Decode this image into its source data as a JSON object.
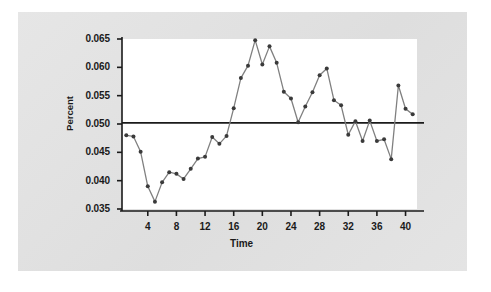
{
  "figure": {
    "background_color": "#ffffff",
    "panel_color": "#e2e2e2",
    "plot_background": "#ffffff"
  },
  "axis": {
    "y_label": "Percent",
    "x_label": "Time",
    "y_ticks": [
      "0.065",
      "0.060",
      "0.055",
      "0.050",
      "0.045",
      "0.040",
      "0.035"
    ],
    "x_ticks": [
      "4",
      "8",
      "12",
      "16",
      "20",
      "24",
      "28",
      "32",
      "36",
      "40"
    ]
  },
  "chart_data": {
    "type": "line",
    "title": "",
    "subtitle": "",
    "xlabel": "Time",
    "ylabel": "Percent",
    "xlim": [
      0.4,
      41.6
    ],
    "ylim": [
      0.035,
      0.065
    ],
    "grid": false,
    "legend": null,
    "marker": "filled-circle",
    "line_color": "#808080",
    "marker_color": "#3a3a3a",
    "reference_line": {
      "type": "horizontal",
      "value": 0.0502,
      "color": "#1a1a1a",
      "label": ""
    },
    "x_tick_values": [
      4,
      8,
      12,
      16,
      20,
      24,
      28,
      32,
      36,
      40
    ],
    "y_tick_values": [
      0.035,
      0.04,
      0.045,
      0.05,
      0.055,
      0.06,
      0.065
    ],
    "x": [
      1,
      2,
      3,
      4,
      5,
      6,
      7,
      8,
      9,
      10,
      11,
      12,
      13,
      14,
      15,
      16,
      17,
      18,
      19,
      20,
      21,
      22,
      23,
      24,
      25,
      26,
      27,
      28,
      29,
      30,
      31,
      32,
      33,
      34,
      35,
      36,
      37,
      38,
      39,
      40,
      41
    ],
    "values": [
      0.048,
      0.0478,
      0.0451,
      0.039,
      0.0363,
      0.0397,
      0.0415,
      0.0412,
      0.0403,
      0.0421,
      0.0439,
      0.0442,
      0.0477,
      0.0465,
      0.0479,
      0.0528,
      0.0581,
      0.0603,
      0.0648,
      0.0605,
      0.0637,
      0.0608,
      0.0557,
      0.0545,
      0.0503,
      0.0531,
      0.0556,
      0.0586,
      0.0598,
      0.0542,
      0.0533,
      0.0481,
      0.0505,
      0.047,
      0.0506,
      0.047,
      0.0473,
      0.0438,
      0.0568,
      0.0527,
      0.0517
    ]
  }
}
